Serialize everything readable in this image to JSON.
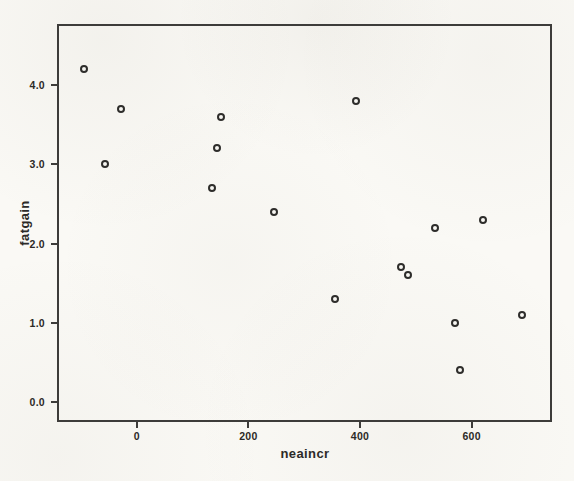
{
  "chart_data": {
    "type": "scatter",
    "title": "",
    "xlabel": "neaincr",
    "ylabel": "fatgain",
    "points": [
      {
        "x": -94,
        "y": 4.2
      },
      {
        "x": -57,
        "y": 3.0
      },
      {
        "x": -29,
        "y": 3.7
      },
      {
        "x": 135,
        "y": 2.7
      },
      {
        "x": 143,
        "y": 3.2
      },
      {
        "x": 151,
        "y": 3.6
      },
      {
        "x": 245,
        "y": 2.4
      },
      {
        "x": 355,
        "y": 1.3
      },
      {
        "x": 392,
        "y": 3.8
      },
      {
        "x": 473,
        "y": 1.7
      },
      {
        "x": 486,
        "y": 1.6
      },
      {
        "x": 535,
        "y": 2.2
      },
      {
        "x": 571,
        "y": 1.0
      },
      {
        "x": 580,
        "y": 0.4
      },
      {
        "x": 620,
        "y": 2.3
      },
      {
        "x": 690,
        "y": 1.1
      }
    ],
    "x_ticks": {
      "values": [
        0,
        200,
        400,
        600
      ],
      "labels": [
        "0",
        "200",
        "400",
        "600"
      ]
    },
    "y_ticks": {
      "values": [
        0,
        1,
        2,
        3,
        4
      ],
      "labels": [
        "0.0",
        "1.0",
        "2.0",
        "3.0",
        "4.0"
      ]
    },
    "xlim": [
      -143,
      744
    ],
    "ylim": [
      -0.25,
      4.77
    ],
    "grid": false,
    "legend": "none",
    "marker": {
      "shape": "open-circle",
      "color": "#2e2d2b"
    },
    "frame_color": "#3d3c3a",
    "paper_color": "#faf9f5"
  }
}
